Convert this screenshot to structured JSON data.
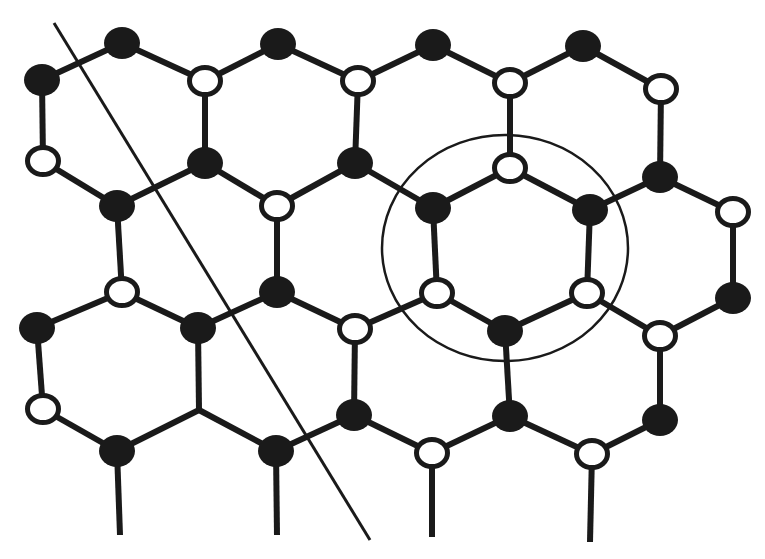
{
  "figure": {
    "colors": {
      "ink": "#1a1a1a",
      "background": "#ffffff",
      "open_fill": "#ffffff"
    },
    "node_style": {
      "radius_x": 18,
      "radius_y": 16,
      "open_stroke_width": 5
    },
    "edge_width": 6,
    "nodes": [
      {
        "id": "A",
        "x": 42,
        "y": 80,
        "type": "filled"
      },
      {
        "id": "B",
        "x": 122,
        "y": 43,
        "type": "filled"
      },
      {
        "id": "C",
        "x": 205,
        "y": 81,
        "type": "open"
      },
      {
        "id": "D",
        "x": 278,
        "y": 44,
        "type": "filled"
      },
      {
        "id": "E",
        "x": 358,
        "y": 81,
        "type": "open"
      },
      {
        "id": "F",
        "x": 433,
        "y": 45,
        "type": "filled"
      },
      {
        "id": "G",
        "x": 510,
        "y": 83,
        "type": "open"
      },
      {
        "id": "H",
        "x": 583,
        "y": 46,
        "type": "filled"
      },
      {
        "id": "I",
        "x": 661,
        "y": 89,
        "type": "open"
      },
      {
        "id": "J",
        "x": 43,
        "y": 161,
        "type": "open"
      },
      {
        "id": "K",
        "x": 205,
        "y": 163,
        "type": "filled"
      },
      {
        "id": "L",
        "x": 355,
        "y": 163,
        "type": "filled"
      },
      {
        "id": "M",
        "x": 510,
        "y": 168,
        "type": "open"
      },
      {
        "id": "N",
        "x": 660,
        "y": 177,
        "type": "filled"
      },
      {
        "id": "O",
        "x": 117,
        "y": 206,
        "type": "filled"
      },
      {
        "id": "P",
        "x": 277,
        "y": 206,
        "type": "open"
      },
      {
        "id": "Q",
        "x": 433,
        "y": 208,
        "type": "filled"
      },
      {
        "id": "R",
        "x": 590,
        "y": 210,
        "type": "filled"
      },
      {
        "id": "S",
        "x": 733,
        "y": 212,
        "type": "open"
      },
      {
        "id": "T",
        "x": 122,
        "y": 292,
        "type": "open"
      },
      {
        "id": "U",
        "x": 277,
        "y": 292,
        "type": "filled"
      },
      {
        "id": "V",
        "x": 437,
        "y": 293,
        "type": "open"
      },
      {
        "id": "W",
        "x": 587,
        "y": 293,
        "type": "open"
      },
      {
        "id": "X",
        "x": 733,
        "y": 298,
        "type": "filled"
      },
      {
        "id": "Y",
        "x": 37,
        "y": 328,
        "type": "filled"
      },
      {
        "id": "Z",
        "x": 198,
        "y": 328,
        "type": "filled"
      },
      {
        "id": "AA",
        "x": 355,
        "y": 329,
        "type": "open"
      },
      {
        "id": "AB",
        "x": 505,
        "y": 331,
        "type": "filled"
      },
      {
        "id": "AC",
        "x": 660,
        "y": 336,
        "type": "open"
      },
      {
        "id": "AD",
        "x": 43,
        "y": 409,
        "type": "open"
      },
      {
        "id": "AE",
        "x": 199,
        "y": 410,
        "type": "none"
      },
      {
        "id": "AF",
        "x": 354,
        "y": 415,
        "type": "filled"
      },
      {
        "id": "AG",
        "x": 510,
        "y": 416,
        "type": "filled"
      },
      {
        "id": "AH",
        "x": 660,
        "y": 420,
        "type": "filled"
      },
      {
        "id": "AI",
        "x": 117,
        "y": 451,
        "type": "filled"
      },
      {
        "id": "AJ",
        "x": 276,
        "y": 451,
        "type": "filled"
      },
      {
        "id": "AK",
        "x": 432,
        "y": 453,
        "type": "open"
      },
      {
        "id": "AL",
        "x": 592,
        "y": 454,
        "type": "open"
      },
      {
        "id": "S1",
        "x": 120,
        "y": 535,
        "type": "none"
      },
      {
        "id": "S2",
        "x": 277,
        "y": 535,
        "type": "none"
      },
      {
        "id": "S3",
        "x": 432,
        "y": 537,
        "type": "none"
      },
      {
        "id": "S4",
        "x": 590,
        "y": 542,
        "type": "none"
      }
    ],
    "edges": [
      [
        "A",
        "B"
      ],
      [
        "B",
        "C"
      ],
      [
        "C",
        "D"
      ],
      [
        "D",
        "E"
      ],
      [
        "E",
        "F"
      ],
      [
        "F",
        "G"
      ],
      [
        "G",
        "H"
      ],
      [
        "H",
        "I"
      ],
      [
        "A",
        "J"
      ],
      [
        "C",
        "K"
      ],
      [
        "E",
        "L"
      ],
      [
        "G",
        "M"
      ],
      [
        "I",
        "N"
      ],
      [
        "J",
        "O"
      ],
      [
        "O",
        "K"
      ],
      [
        "K",
        "P"
      ],
      [
        "P",
        "L"
      ],
      [
        "L",
        "Q"
      ],
      [
        "Q",
        "M"
      ],
      [
        "M",
        "R"
      ],
      [
        "R",
        "N"
      ],
      [
        "N",
        "S"
      ],
      [
        "O",
        "T"
      ],
      [
        "P",
        "U"
      ],
      [
        "Q",
        "V"
      ],
      [
        "R",
        "W"
      ],
      [
        "S",
        "X"
      ],
      [
        "Y",
        "T"
      ],
      [
        "T",
        "Z"
      ],
      [
        "Z",
        "U"
      ],
      [
        "U",
        "AA"
      ],
      [
        "AA",
        "V"
      ],
      [
        "V",
        "AB"
      ],
      [
        "AB",
        "W"
      ],
      [
        "W",
        "AC"
      ],
      [
        "AC",
        "X"
      ],
      [
        "Y",
        "AD"
      ],
      [
        "Z",
        "AE"
      ],
      [
        "AA",
        "AF"
      ],
      [
        "AB",
        "AG"
      ],
      [
        "AC",
        "AH"
      ],
      [
        "AD",
        "AI"
      ],
      [
        "AI",
        "AE"
      ],
      [
        "AE",
        "AJ"
      ],
      [
        "AJ",
        "AF"
      ],
      [
        "AF",
        "AK"
      ],
      [
        "AK",
        "AG"
      ],
      [
        "AG",
        "AL"
      ],
      [
        "AL",
        "AH"
      ],
      [
        "AI",
        "S1"
      ],
      [
        "AJ",
        "S2"
      ],
      [
        "AK",
        "S3"
      ],
      [
        "AL",
        "S4"
      ]
    ],
    "cut_line": {
      "x1": 54,
      "y1": 23,
      "x2": 370,
      "y2": 540,
      "width": 3
    },
    "highlight_circle": {
      "cx": 505,
      "cy": 248,
      "rx": 123,
      "ry": 113,
      "width": 2.5
    }
  }
}
